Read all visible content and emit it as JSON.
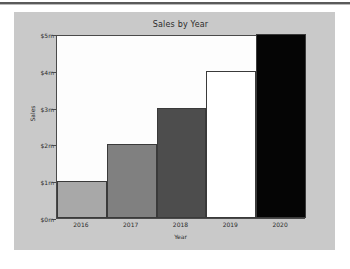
{
  "figure": {
    "background_color": "#c9c9c9",
    "page_background_color": "#ffffff",
    "plot_background_color": "#fdfdfd",
    "axis_color": "#4a4a4a"
  },
  "chart_data": {
    "type": "bar",
    "title": "Sales by Year",
    "xlabel": "Year",
    "ylabel": "Sales",
    "categories": [
      "2016",
      "2017",
      "2018",
      "2019",
      "2020"
    ],
    "values": [
      1,
      2,
      3,
      4,
      5
    ],
    "value_unit": "m",
    "value_prefix": "$",
    "ylim": [
      0,
      5
    ],
    "yticks": [
      0,
      1,
      2,
      3,
      4,
      5
    ],
    "ytick_labels": [
      "$0m",
      "$1m",
      "$2m",
      "$3m",
      "$4m",
      "$5m"
    ],
    "grid": false,
    "legend": null,
    "bar_colors": [
      "#a8a8a8",
      "#808080",
      "#4d4d4d",
      "#ffffff",
      "#050505"
    ],
    "bar_edge_color": "#3a3a3a",
    "bar_width_fraction": 1.0
  }
}
